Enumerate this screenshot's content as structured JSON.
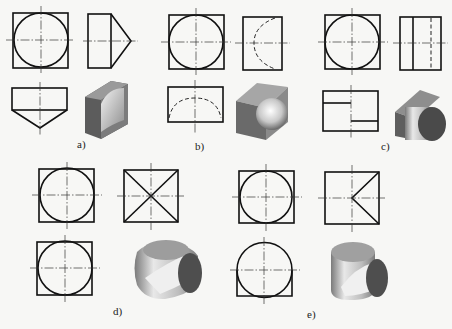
{
  "figure": {
    "panels": [
      {
        "id": "a",
        "label": "a)",
        "description": "Square plate with cone-like spherical notch: front view circle in square, side view rectangle with triangle point, top view rectangle with triangle point"
      },
      {
        "id": "b",
        "label": "b)",
        "description": "Cube with inscribed hemisphere: front view circle in square, side view square with hidden arc, top view rectangle with hidden arc"
      },
      {
        "id": "c",
        "label": "c)",
        "description": "Cube with cylinder boss: front view circle in square, side view rectangle with vertical lines, top view rectangle with step lines"
      },
      {
        "id": "d",
        "label": "d)",
        "description": "Intersection of two cylinders: front and top views circle in square, side view square with diagonals"
      },
      {
        "id": "e",
        "label": "e)",
        "description": "Cylinder intersected by cylinder: front view circle in square, side view square with half-X, top view circle with partial square"
      }
    ],
    "colors": {
      "line": "#111111",
      "background": "#f7f7f5",
      "solid_light": "#d9d9d9",
      "solid_mid": "#9a9a9a",
      "solid_dark": "#4a4a4a"
    }
  }
}
